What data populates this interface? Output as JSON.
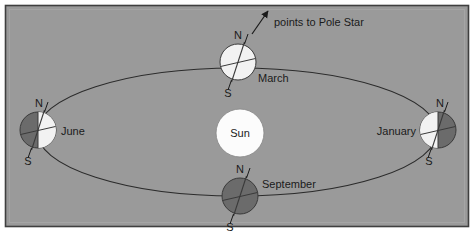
{
  "figure": {
    "background_color": "#9a9a9a",
    "border_color": "#3f3f3f",
    "outer_color": "#ffffff",
    "orbit_color": "#2b2b2b",
    "sun_color": "#fcfcfc",
    "earth_light_color": "#f2f2f2",
    "earth_dark_color": "#6b6b6b",
    "label_color": "#1a1a1a"
  },
  "sun": {
    "label": "Sun",
    "cx": 240,
    "cy": 133,
    "r": 24
  },
  "orbit": {
    "cx": 237,
    "cy": 132,
    "rx": 200,
    "ry": 64
  },
  "pole_star": {
    "label": "points to Pole Star",
    "arrow_tail_x": 252,
    "arrow_tail_y": 34,
    "arrow_head_x": 268,
    "arrow_head_y": 10
  },
  "earths": [
    {
      "id": "march",
      "label": "March",
      "cx": 238,
      "cy": 62,
      "r": 18,
      "lit": "full",
      "label_x": 258,
      "label_y": 81,
      "pole_n": "N",
      "pole_s": "S",
      "n_x": 238,
      "n_y": 36,
      "s_x": 228,
      "s_y": 94
    },
    {
      "id": "june",
      "label": "June",
      "cx": 38,
      "cy": 130,
      "r": 18,
      "lit": "right",
      "label_x": 60,
      "label_y": 135,
      "pole_n": "N",
      "pole_s": "S",
      "n_x": 41,
      "n_y": 104,
      "s_x": 31,
      "s_y": 162
    },
    {
      "id": "september",
      "label": "September",
      "cx": 240,
      "cy": 196,
      "r": 18,
      "lit": "none",
      "label_x": 262,
      "label_y": 187,
      "pole_n": "N",
      "pole_s": "S",
      "n_x": 241,
      "n_y": 170,
      "s_x": 231,
      "s_y": 228
    },
    {
      "id": "january",
      "label": "January",
      "cx": 438,
      "cy": 130,
      "r": 18,
      "lit": "left",
      "label_x": 418,
      "label_y": 135,
      "label_anchor": "end",
      "pole_n": "N",
      "pole_s": "S",
      "n_x": 440,
      "n_y": 104,
      "s_x": 431,
      "s_y": 162
    }
  ]
}
